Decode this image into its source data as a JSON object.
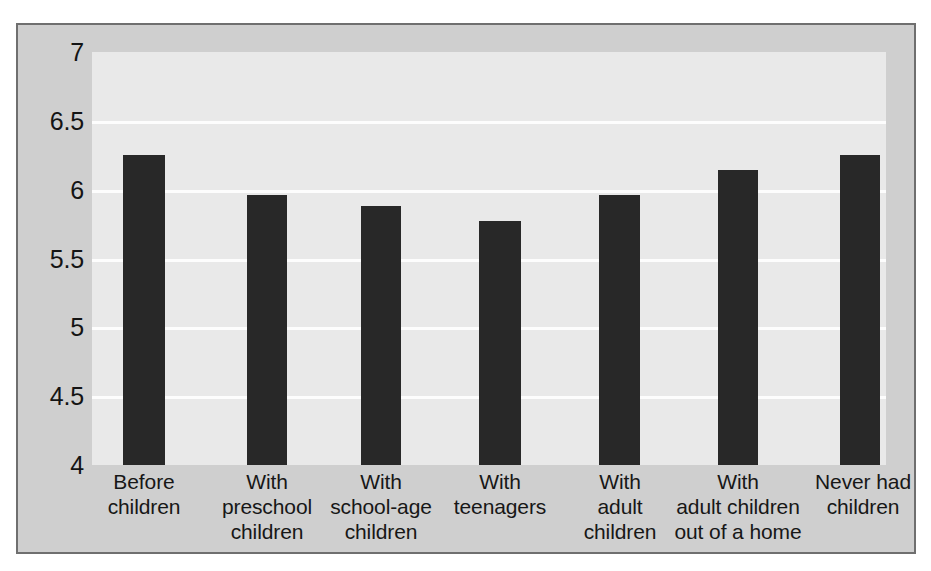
{
  "chart_data": {
    "type": "bar",
    "title": "",
    "subtitle": "",
    "xlabel": "",
    "ylabel": "",
    "ylim": [
      4,
      7
    ],
    "grid": true,
    "legend": "none",
    "y_ticks": [
      "7",
      "6.5",
      "6",
      "5.5",
      "5",
      "4.5",
      "4"
    ],
    "y_tick_values": [
      7,
      6.5,
      6,
      5.5,
      5,
      4.5,
      4
    ],
    "categories": [
      "Before children",
      "With preschool children",
      "With school-age children",
      "With teenagers",
      "With adult children",
      "With adult children out of a home",
      "Never had children"
    ],
    "category_lines": [
      [
        "Before",
        "children"
      ],
      [
        "With",
        "preschool",
        "children"
      ],
      [
        "With",
        "school-age",
        "children"
      ],
      [
        "With",
        "teenagers"
      ],
      [
        "With",
        "adult",
        "children"
      ],
      [
        "With",
        "adult children",
        "out of a home"
      ],
      [
        "Never had",
        "children"
      ]
    ],
    "values": [
      6.25,
      5.96,
      5.88,
      5.77,
      5.96,
      6.14,
      6.25
    ],
    "colors": {
      "bar": "#282828",
      "plot_background": "#e9e9e9",
      "figure_background": "#cfcfcf",
      "gridline": "#fdfdfd",
      "frame_border": "#6f6f6f",
      "text": "#141414"
    }
  }
}
